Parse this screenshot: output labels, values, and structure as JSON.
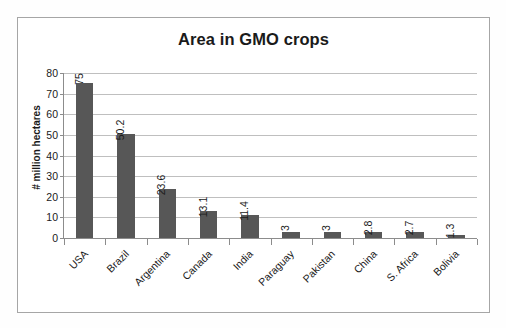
{
  "chart_data": {
    "type": "bar",
    "title": "Area in GMO crops",
    "xlabel": "",
    "ylabel": "# million hectares",
    "categories": [
      "USA",
      "Brazil",
      "Argentina",
      "Canada",
      "India",
      "Paraguay",
      "Pakistan",
      "China",
      "S. Africa",
      "Bolivia"
    ],
    "values": [
      75,
      50.2,
      23.6,
      13.1,
      11.4,
      3,
      3,
      2.8,
      2.7,
      1.3
    ],
    "value_labels": [
      "75",
      "50.2",
      "23.6",
      "13.1",
      "11.4",
      "3",
      "3",
      "2.8",
      "2.7",
      "1.3"
    ],
    "ylim": [
      0,
      80
    ],
    "ytick_values": [
      80,
      70,
      60,
      50,
      40,
      30,
      20,
      10,
      0
    ],
    "ytick_labels": [
      "80",
      "70",
      "60",
      "50",
      "40",
      "30",
      "20",
      "10",
      "0"
    ],
    "grid": true,
    "legend": "none",
    "series": [
      {
        "name": "Area in GMO crops",
        "values": [
          75,
          50.2,
          23.6,
          13.1,
          11.4,
          3,
          3,
          2.8,
          2.7,
          1.3
        ]
      }
    ]
  },
  "colors": {
    "bar": "#575757",
    "gridline": "#bfbfbf",
    "axis": "#8c8c8c",
    "frame": "#a6a6a6",
    "text": "#1a1a1a",
    "background": "#ffffff"
  }
}
